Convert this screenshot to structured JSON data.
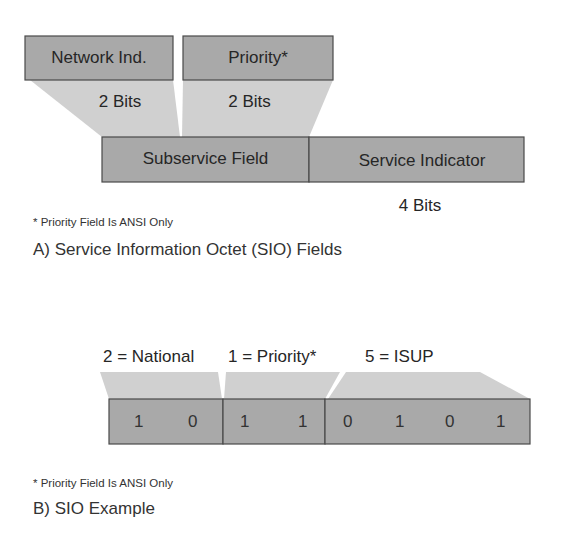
{
  "colors": {
    "box_fill": "#a9a9a9",
    "wedge_fill": "#d0d0d0",
    "border": "#555555",
    "text": "#262626"
  },
  "section_a": {
    "fields_top": [
      {
        "label": "Network Ind.",
        "bits": "2 Bits"
      },
      {
        "label": "Priority*",
        "bits": "2 Bits"
      }
    ],
    "fields_bottom": [
      {
        "label": "Subservice Field"
      },
      {
        "label": "Service Indicator",
        "bits": "4 Bits"
      }
    ],
    "footnote": "* Priority Field Is ANSI Only",
    "caption": "A) Service Information Octet (SIO) Fields"
  },
  "section_b": {
    "groups": [
      {
        "label": "2 = National",
        "bits": [
          "1",
          "0"
        ]
      },
      {
        "label": "1 = Priority*",
        "bits": [
          "1",
          "1"
        ]
      },
      {
        "label": "5 = ISUP",
        "bits": [
          "0",
          "1",
          "0",
          "1"
        ]
      }
    ],
    "footnote": "* Priority Field Is ANSI Only",
    "caption": "B) SIO Example"
  }
}
